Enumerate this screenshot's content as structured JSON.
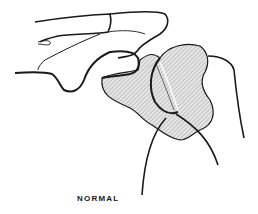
{
  "figure": {
    "caption": "NORMAL",
    "colors": {
      "line": "#1a1a1a",
      "hatch": "#8a8a8a",
      "fill": "#e6e6e6",
      "background": "#ffffff"
    }
  }
}
